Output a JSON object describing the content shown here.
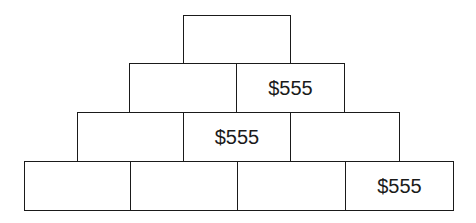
{
  "pyramid": {
    "rows": [
      {
        "bricks": [
          {
            "label": ""
          }
        ]
      },
      {
        "bricks": [
          {
            "label": ""
          },
          {
            "label": "$555"
          }
        ]
      },
      {
        "bricks": [
          {
            "label": ""
          },
          {
            "label": "$555"
          },
          {
            "label": ""
          }
        ]
      },
      {
        "bricks": [
          {
            "label": ""
          },
          {
            "label": ""
          },
          {
            "label": ""
          },
          {
            "label": "$555"
          }
        ]
      }
    ]
  }
}
